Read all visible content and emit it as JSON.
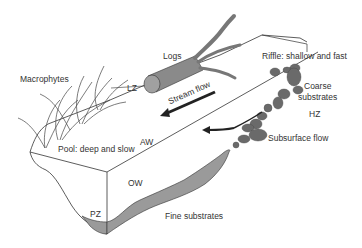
{
  "diagram": {
    "type": "stream-reach-cross-section",
    "labels": {
      "logs": "Logs",
      "macrophytes": "Macrophytes",
      "lz": "LZ",
      "riffle": "Riffle: shallow and fast",
      "coarse_line1": "Coarse",
      "coarse_line2": "substrates",
      "stream_flow": "Stream flow",
      "hz": "HZ",
      "subsurface_flow": "Subsurface flow",
      "aw": "AW",
      "pool": "Pool: deep and slow",
      "ow": "OW",
      "pz": "PZ",
      "fine_substrates": "Fine substrates"
    },
    "colors": {
      "outline": "#333333",
      "fine_substrate_fill": "#9a9a9a",
      "coarse_substrate_fill": "#6a6a6a",
      "log_fill": "#8a8a8a",
      "arrow": "#222222",
      "text": "#333333"
    }
  }
}
